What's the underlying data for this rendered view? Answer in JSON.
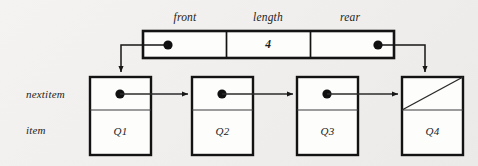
{
  "diagram": {
    "background_color": "#f1f0ee",
    "ink_color": "#121212",
    "header_record": {
      "fields": [
        {
          "label": "front",
          "value": "",
          "kind": "pointer",
          "target": "Q1"
        },
        {
          "label": "length",
          "value": "4",
          "kind": "number"
        },
        {
          "label": "rear",
          "value": "",
          "kind": "pointer",
          "target": "Q4"
        }
      ]
    },
    "row_labels": [
      {
        "name": "nextitem",
        "text": "nextitem"
      },
      {
        "name": "item",
        "text": "item"
      }
    ],
    "nodes": [
      {
        "id": "node-1",
        "item": "Q1",
        "nextitem": "pointer",
        "next_target": "Q2"
      },
      {
        "id": "node-2",
        "item": "Q2",
        "nextitem": "pointer",
        "next_target": "Q3"
      },
      {
        "id": "node-3",
        "item": "Q3",
        "nextitem": "pointer",
        "next_target": "Q4"
      },
      {
        "id": "node-4",
        "item": "Q4",
        "nextitem": "null",
        "next_target": ""
      }
    ],
    "null_marker": "diagonal-slash"
  }
}
